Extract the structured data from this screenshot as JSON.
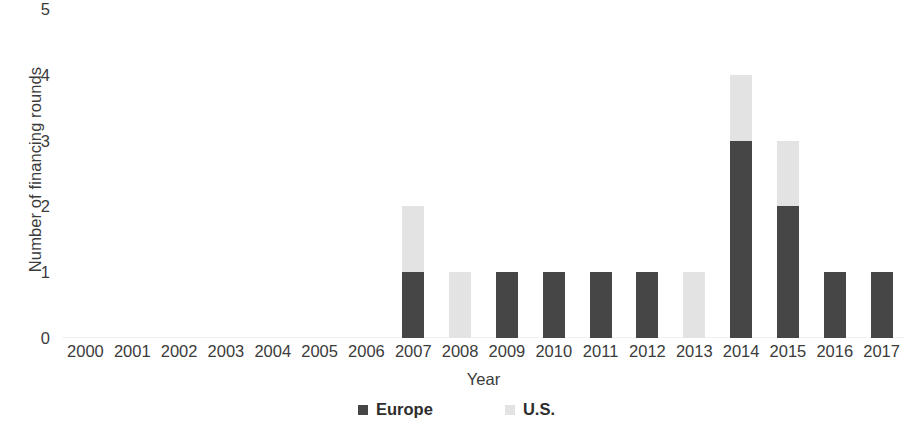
{
  "chart_data": {
    "type": "bar",
    "stacked": true,
    "title": "",
    "xlabel": "Year",
    "ylabel": "Number of financing rounds",
    "categories": [
      "2000",
      "2001",
      "2002",
      "2003",
      "2004",
      "2005",
      "2006",
      "2007",
      "2008",
      "2009",
      "2010",
      "2011",
      "2012",
      "2013",
      "2014",
      "2015",
      "2016",
      "2017"
    ],
    "series": [
      {
        "name": "Europe",
        "color": "#464646",
        "values": [
          0,
          0,
          0,
          0,
          0,
          0,
          0,
          1,
          0,
          1,
          1,
          1,
          1,
          0,
          3,
          2,
          1,
          1
        ]
      },
      {
        "name": "U.S.",
        "color": "#e3e3e3",
        "values": [
          0,
          0,
          0,
          0,
          0,
          0,
          0,
          1,
          1,
          0,
          0,
          0,
          0,
          1,
          1,
          1,
          0,
          0
        ]
      }
    ],
    "totals": [
      0,
      0,
      0,
      0,
      0,
      0,
      0,
      2,
      1,
      1,
      1,
      1,
      1,
      1,
      4,
      3,
      1,
      1
    ],
    "yticks": [
      "0",
      "1",
      "2",
      "3",
      "4",
      "5"
    ],
    "ylim": [
      0,
      5
    ],
    "grid": false,
    "legend_position": "bottom"
  },
  "axes": {
    "y_title": "Number of financing rounds",
    "x_title": "Year",
    "y_ticks": [
      "5",
      "4",
      "3",
      "2",
      "1",
      "0"
    ],
    "x_ticks": [
      "2000",
      "2001",
      "2002",
      "2003",
      "2004",
      "2005",
      "2006",
      "2007",
      "2008",
      "2009",
      "2010",
      "2011",
      "2012",
      "2013",
      "2014",
      "2015",
      "2016",
      "2017"
    ]
  },
  "legend": {
    "items": [
      {
        "label": "Europe",
        "color": "#464646"
      },
      {
        "label": "U.S.",
        "color": "#e3e3e3"
      }
    ]
  }
}
